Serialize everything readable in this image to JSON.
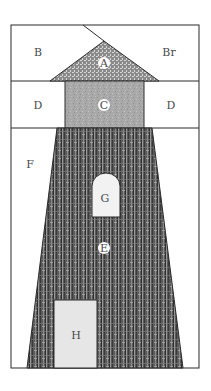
{
  "diagram": {
    "colors": {
      "outline": "#2a2a2a",
      "background": "#ffffff",
      "roof_fill": "#7a7a7a",
      "lantern_fill": "#a8a8a8",
      "tower_fill": "#555555",
      "window_fill": "#f2f2f2",
      "door_fill": "#e6e6e6"
    },
    "pieces": {
      "A": "A",
      "B": "B",
      "Br": "Br",
      "C": "C",
      "D_left": "D",
      "D_right": "D",
      "E": "E",
      "F": "F",
      "G": "G",
      "H": "H"
    }
  }
}
